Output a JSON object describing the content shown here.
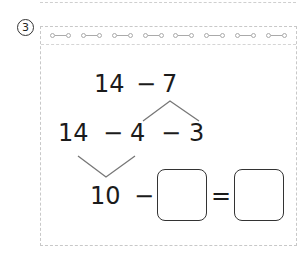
{
  "problem": {
    "number_label": "3",
    "line1": {
      "a": "14",
      "op": "−",
      "b": "7"
    },
    "line2": {
      "a": "14",
      "op1": "−",
      "b": "4",
      "op2": "−",
      "c": "3"
    },
    "line3": {
      "a": "10",
      "op": "−",
      "eq": "="
    },
    "answer_boxes": [
      "",
      ""
    ]
  },
  "notebook": {
    "ring_count": 8
  },
  "colors": {
    "text": "#1b1b1b",
    "lines": "#777777",
    "border": "#c8c8c8"
  }
}
